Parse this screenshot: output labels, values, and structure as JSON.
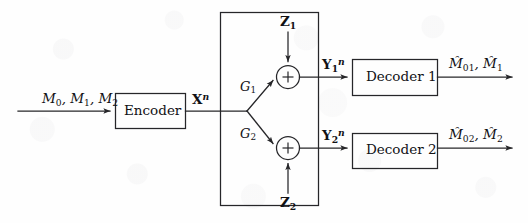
{
  "figure": {
    "kind": "block-diagram",
    "canvas": {
      "width": 528,
      "height": 223
    },
    "colors": {
      "background": "#fefefe",
      "stroke": "#262629",
      "text": "#111115"
    }
  },
  "blocks": {
    "encoder": {
      "label": "Encoder"
    },
    "decoder1": {
      "label": "Decoder 1"
    },
    "decoder2": {
      "label": "Decoder 2"
    },
    "channel_boundary": {
      "label": ""
    }
  },
  "adders": {
    "adder1": {
      "symbol": "+"
    },
    "adder2": {
      "symbol": "+"
    }
  },
  "signals": {
    "input_messages": {
      "html": "M<sub>0</sub>, M<sub>1</sub>, M<sub>2</sub>",
      "text": "M0, M1, M2"
    },
    "codeword": {
      "html": "X<sup>n</sup>",
      "text": "X^n"
    },
    "gain1": {
      "html": "G<sub>1</sub>",
      "text": "G1"
    },
    "gain2": {
      "html": "G<sub>2</sub>",
      "text": "G2"
    },
    "noise1": {
      "html": "Z<sub>1</sub>",
      "text": "Z1"
    },
    "noise2": {
      "html": "Z<sub>2</sub>",
      "text": "Z2"
    },
    "received1": {
      "html": "Y<sub>1</sub><sup>n</sup>",
      "text": "Y1^n"
    },
    "received2": {
      "html": "Y<sub>2</sub><sup>n</sup>",
      "text": "Y2^n"
    },
    "estimate1": {
      "html": "M&#770;<sub>01</sub>, M&#770;<sub>1</sub>",
      "text": "M01-hat, M1-hat"
    },
    "estimate2": {
      "html": "M&#770;<sub>02</sub>, M&#770;<sub>2</sub>",
      "text": "M02-hat, M2-hat"
    }
  }
}
